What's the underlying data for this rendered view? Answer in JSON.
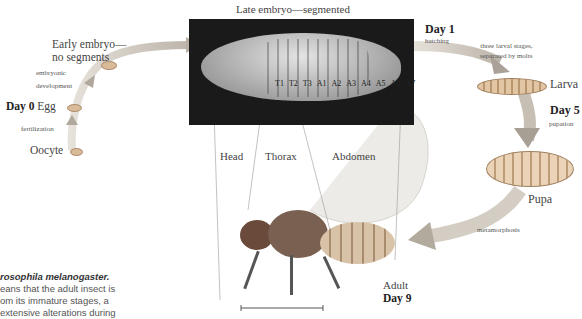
{
  "early_stages": {
    "early_embryo": [
      "Early embryo—",
      "no segments"
    ],
    "embryonic_development": [
      "embryonic",
      "development"
    ],
    "day0": "Day 0",
    "egg": "Egg",
    "fertilization": "fertilization",
    "oocyte": "Oocyte"
  },
  "late_embryo": {
    "title": "Late embryo—segmented",
    "segments": [
      "T1",
      "T2",
      "T3",
      "A1",
      "A2",
      "A3",
      "A4",
      "A5",
      "A6",
      "A7"
    ]
  },
  "larval": {
    "day1": "Day 1",
    "hatching": "hatching",
    "stages_note": [
      "three larval stages,",
      "separated by molts"
    ],
    "larva": "Larva",
    "day5": "Day 5",
    "pupation": "pupation",
    "pupa": "Pupa",
    "metamorphosis": "metamorphosis"
  },
  "adult": {
    "head": "Head",
    "thorax": "Thorax",
    "abdomen": "Abdomen",
    "adult": "Adult",
    "day9": "Day 9"
  },
  "caption": {
    "title": "rosophila melanogaster.",
    "lines": [
      "eans that the adult insect is",
      "om its immature stages, a",
      "extensive alterations during"
    ]
  },
  "colors": {
    "arrow": "#c9c2b8",
    "embryo_bg": "#1a1a1a",
    "stage_body": "#d8b896"
  }
}
